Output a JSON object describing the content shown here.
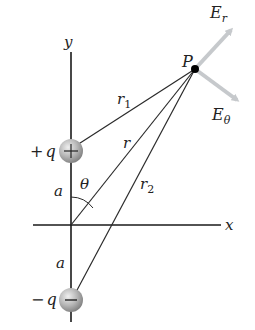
{
  "figure": {
    "type": "electric dipole field diagram",
    "colors": {
      "axis": "#1a1a1a",
      "line": "#2a2a2a",
      "arrow": "#c6c9cc",
      "charge_fill_light": "#f0f0f0",
      "charge_fill_dark": "#8a8a8a",
      "point": "#000000"
    },
    "axes": {
      "x_label": "x",
      "y_label": "y"
    },
    "charges": {
      "positive": {
        "label_sign": "+",
        "label_var": "q",
        "symbol": "+"
      },
      "negative": {
        "label_sign": "−",
        "label_var": "q",
        "symbol": "−"
      }
    },
    "point": {
      "label": "P"
    },
    "distances": {
      "r1": {
        "base": "r",
        "sub": "1"
      },
      "r": {
        "base": "r"
      },
      "r2": {
        "base": "r",
        "sub": "2"
      },
      "a_upper": "a",
      "a_lower": "a"
    },
    "angle": {
      "label": "θ"
    },
    "vectors": {
      "E_r": {
        "base": "E",
        "sub": "r"
      },
      "E_theta": {
        "base": "E",
        "sub": "θ"
      }
    }
  }
}
